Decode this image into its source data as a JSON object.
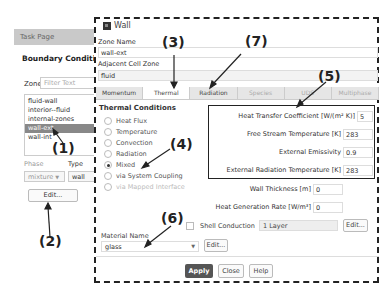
{
  "task_page": {
    "header": "Task Page",
    "title": "Boundary Conditions",
    "zone_label": "Zone",
    "zone_filter_placeholder": "Filter Text",
    "zones": [
      {
        "label": "fluid-wall",
        "selected": false
      },
      {
        "label": "interior--fluid",
        "selected": false
      },
      {
        "label": "internal-zones",
        "selected": false
      },
      {
        "label": "wall-ext",
        "selected": true
      },
      {
        "label": "wall-int",
        "selected": false
      }
    ],
    "phase_label": "Phase",
    "phase_value": "mixture",
    "type_label": "Type",
    "type_value": "wall",
    "edit_label": "Edit..."
  },
  "dialog": {
    "title": "Wall",
    "zone_name_label": "Zone Name",
    "zone_name_value": "wall-ext",
    "adjacent_label": "Adjacent Cell Zone",
    "adjacent_value": "fluid",
    "tabs": [
      {
        "label": "Momentum",
        "active": false,
        "dim": false
      },
      {
        "label": "Thermal",
        "active": true,
        "dim": false
      },
      {
        "label": "Radiation",
        "active": false,
        "dim": false
      },
      {
        "label": "Species",
        "active": false,
        "dim": true
      },
      {
        "label": "UDS",
        "active": false,
        "dim": true
      },
      {
        "label": "Multiphase",
        "active": false,
        "dim": true
      }
    ],
    "thermal_conditions_title": "Thermal Conditions",
    "thermal_options": [
      {
        "label": "Heat Flux",
        "checked": false,
        "disabled": false
      },
      {
        "label": "Temperature",
        "checked": false,
        "disabled": false
      },
      {
        "label": "Convection",
        "checked": false,
        "disabled": false
      },
      {
        "label": "Radiation",
        "checked": false,
        "disabled": false
      },
      {
        "label": "Mixed",
        "checked": true,
        "disabled": false
      },
      {
        "label": "via System Coupling",
        "checked": false,
        "disabled": false
      },
      {
        "label": "via Mapped Interface",
        "checked": false,
        "disabled": true
      }
    ],
    "mixed_props": [
      {
        "label": "Heat Transfer Coefficient [W/(m² K)]",
        "value": "5"
      },
      {
        "label": "Free Stream Temperature [K]",
        "value": "283"
      },
      {
        "label": "External Emissivity",
        "value": "0.9"
      },
      {
        "label": "External Radiation Temperature [K]",
        "value": "283"
      }
    ],
    "wall_thickness_label": "Wall Thickness [m]",
    "wall_thickness_value": "0",
    "heat_gen_label": "Heat Generation Rate [W/m³]",
    "heat_gen_value": "0",
    "shell_conduction_label": "Shell Conduction",
    "shell_layers_value": "1 Layer",
    "shell_edit_label": "Edit...",
    "material_label": "Material Name",
    "material_value": "glass",
    "material_edit_label": "Edit...",
    "apply_label": "Apply",
    "close_label": "Close",
    "help_label": "Help"
  },
  "annotations": {
    "a1": "(1)",
    "a2": "(2)",
    "a3": "(3)",
    "a4": "(4)",
    "a5": "(5)",
    "a6": "(6)",
    "a7": "(7)"
  }
}
